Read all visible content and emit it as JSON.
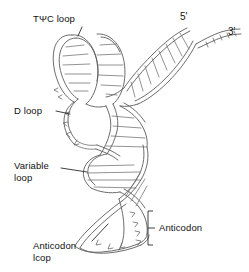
{
  "figure": {
    "background_color": "#ffffff",
    "line_color": "#5b5b5b",
    "label_color": "#111111"
  },
  "labels": {
    "tpsic_loop": "TΨC loop",
    "d_loop": "D loop",
    "variable_loop_line1": "Variable",
    "variable_loop_line2": "loop",
    "anticodon_loop_line1": "Anticodon",
    "anticodon_loop_line2": "lcop",
    "anticodon_bracket": "Anticodon",
    "five_prime": "5'",
    "three_prime": "3'"
  },
  "annotations": [
    {
      "name": "tpsic-loop",
      "text": "TΨC loop",
      "leader": true
    },
    {
      "name": "d-loop",
      "text": "D loop",
      "leader": true
    },
    {
      "name": "variable-loop",
      "text": "Variable loop",
      "leader": true
    },
    {
      "name": "anticodon-loop",
      "text": "Anticodon lcop",
      "leader": true
    },
    {
      "name": "anticodon",
      "text": "Anticodon",
      "leader": false,
      "marker": "square-bracket"
    },
    {
      "name": "five-prime-end",
      "text": "5'",
      "leader": false
    },
    {
      "name": "three-prime-end",
      "text": "3'",
      "leader": false
    }
  ]
}
